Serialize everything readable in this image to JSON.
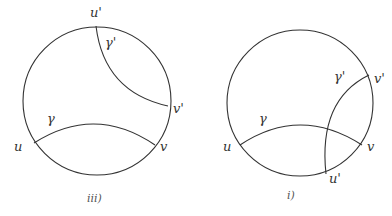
{
  "figures": [
    {
      "caption": "iii)",
      "labels": {
        "u": "u",
        "v": "v",
        "u_prime": "u'",
        "v_prime": "v'",
        "gamma": "γ",
        "gamma_prime": "γ'"
      }
    },
    {
      "caption": "i)",
      "labels": {
        "u": "u",
        "v": "v",
        "u_prime": "u'",
        "v_prime": "v'",
        "gamma": "γ",
        "gamma_prime": "γ'"
      }
    }
  ],
  "colors": {
    "stroke": "#333333",
    "background": "#ffffff"
  }
}
